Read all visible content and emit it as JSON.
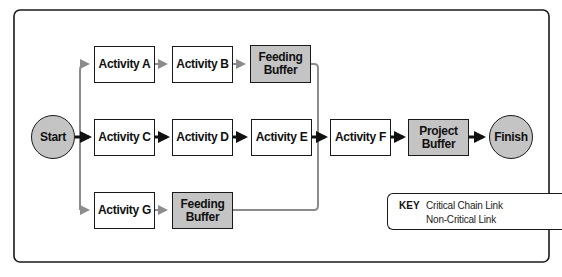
{
  "diagram": {
    "type": "critical-chain-network",
    "colors": {
      "critical": "#111111",
      "non_critical": "#8c8c8c",
      "buffer_fill": "#c4c4c4",
      "border": "#1a1a1a"
    },
    "nodes": {
      "start": "Start",
      "finish": "Finish",
      "activity_a": "Activity A",
      "activity_b": "Activity B",
      "feeding_buffer_1": "Feeding Buffer",
      "activity_c": "Activity C",
      "activity_d": "Activity D",
      "activity_e": "Activity E",
      "activity_f": "Activity F",
      "project_buffer": "Project Buffer",
      "activity_g": "Activity G",
      "feeding_buffer_2": "Feeding Buffer"
    },
    "edges": [
      {
        "from": "Start",
        "to": "Activity A",
        "type": "non-critical"
      },
      {
        "from": "Activity A",
        "to": "Activity B",
        "type": "non-critical"
      },
      {
        "from": "Activity B",
        "to": "Feeding Buffer",
        "type": "non-critical"
      },
      {
        "from": "Feeding Buffer",
        "to": "Activity F",
        "type": "non-critical"
      },
      {
        "from": "Start",
        "to": "Activity C",
        "type": "critical"
      },
      {
        "from": "Activity C",
        "to": "Activity D",
        "type": "critical"
      },
      {
        "from": "Activity D",
        "to": "Activity E",
        "type": "critical"
      },
      {
        "from": "Activity E",
        "to": "Activity F",
        "type": "critical"
      },
      {
        "from": "Activity F",
        "to": "Project Buffer",
        "type": "critical"
      },
      {
        "from": "Project Buffer",
        "to": "Finish",
        "type": "critical"
      },
      {
        "from": "Start",
        "to": "Activity G",
        "type": "non-critical"
      },
      {
        "from": "Activity G",
        "to": "Feeding Buffer",
        "type": "non-critical"
      },
      {
        "from": "Feeding Buffer",
        "to": "Activity F",
        "type": "non-critical"
      }
    ]
  },
  "key": {
    "title": "KEY",
    "critical_label": "Critical Chain Link",
    "non_critical_label": "Non-Critical Link"
  }
}
